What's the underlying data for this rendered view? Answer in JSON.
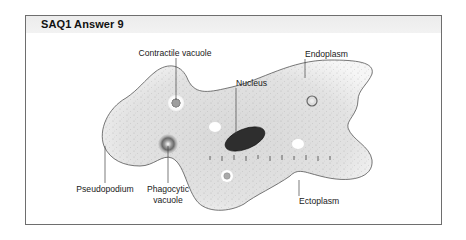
{
  "header": {
    "title": "SAQ1  Answer 9"
  },
  "labels": {
    "contractile_vacuole": "Contractile vacuole",
    "nucleus": "Nucleus",
    "endoplasm": "Endoplasm",
    "pseudopodium": "Pseudopodium",
    "phagocytic_line1": "Phagocytic",
    "phagocytic_line2": "vacuole",
    "ectoplasm": "Ectoplasm"
  },
  "colors": {
    "frame_border": "#6e6e6e",
    "header_bg": "#ececec",
    "cell_fill": "#e4e4e4",
    "nucleus": "#2e2e2e"
  }
}
